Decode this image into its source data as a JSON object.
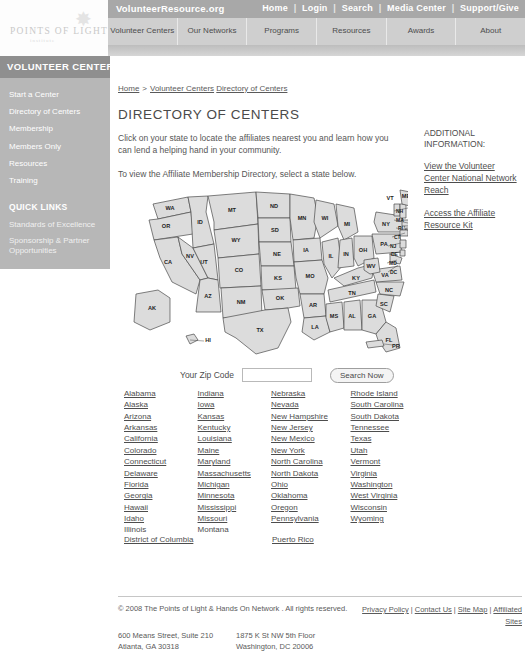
{
  "brand": {
    "logo_text": "POINTS OF LIGHT",
    "logo_subtext": "institute",
    "star_icon": "✸"
  },
  "header": {
    "site_title": "VolunteerResource.org",
    "util_links": [
      "Home",
      "Login",
      "Search",
      "Media Center",
      "Support/Give"
    ],
    "separator": "|",
    "tabs": [
      "Volunteer Centers",
      "Our Networks",
      "Programs",
      "Resources",
      "Awards",
      "About"
    ]
  },
  "sidebar": {
    "title": "VOLUNTEER CENTERS",
    "items": [
      "Start a Center",
      "Directory of Centers",
      "Membership",
      "Members Only",
      "Resources",
      "Training"
    ],
    "quick_links_title": "QUICK LINKS",
    "quick_links": [
      "Standards of Excellence",
      "Sponsorship & Partner Opportunities"
    ]
  },
  "breadcrumb": {
    "home": "Home",
    "separator": ">",
    "section": "Volunteer Centers",
    "current": "Directory of Centers"
  },
  "main": {
    "page_title": "DIRECTORY OF CENTERS",
    "intro": "Click on your state to locate the affiliates nearest you and learn how you can lend a helping hand in your community.",
    "instruction": "To view the Affiliate Membership Directory, select a state below."
  },
  "rail": {
    "heading": "ADDITIONAL INFORMATION:",
    "links": [
      "View the Volunteer Center National Network Reach",
      "Access the Affiliate Resource Kit"
    ]
  },
  "map": {
    "alt": "Clickable map of the United States",
    "state_abbrs": [
      "WA",
      "OR",
      "ID",
      "MT",
      "ND",
      "MN",
      "WI",
      "MI",
      "NY",
      "VT",
      "ME",
      "NH",
      "MA",
      "RI",
      "CT",
      "NJ",
      "DE",
      "MD",
      "DC",
      "PA",
      "OH",
      "IN",
      "IL",
      "IA",
      "NE",
      "SD",
      "WY",
      "UT",
      "NV",
      "CA",
      "AZ",
      "NM",
      "CO",
      "KS",
      "MO",
      "KY",
      "WV",
      "VA",
      "NC",
      "SC",
      "GA",
      "FL",
      "AL",
      "MS",
      "TN",
      "AR",
      "LA",
      "OK",
      "TX",
      "AK",
      "HI",
      "PR"
    ]
  },
  "search": {
    "zip_label": "Your Zip Code",
    "zip_value": "",
    "zip_placeholder": "",
    "button_label": "Search Now"
  },
  "state_columns": [
    [
      "Alabama",
      "Alaska",
      "Arizona",
      "Arkansas",
      "California",
      "Colorado",
      "Connecticut",
      "Delaware",
      "Florida",
      "Georgia",
      "Hawaii",
      "Idaho",
      "Illinois"
    ],
    [
      "Indiana",
      "Iowa",
      "Kansas",
      "Kentucky",
      "Louisiana",
      "Maine",
      "Maryland",
      "Massachusetts",
      "Michigan",
      "Minnesota",
      "Mississippi",
      "Missouri",
      "Montana"
    ],
    [
      "Nebraska",
      "Nevada",
      "New Hampshire",
      "New Jersey",
      "New Mexico",
      "New York",
      "North Carolina",
      "North Dakota",
      "Ohio",
      "Oklahoma",
      "Oregon",
      "Pennsylvania"
    ],
    [
      "Rhode Island",
      "South Carolina",
      "South Dakota",
      "Tennessee",
      "Texas",
      "Utah",
      "Vermont",
      "Virginia",
      "Washington",
      "West Virginia",
      "Wisconsin",
      "Wyoming"
    ]
  ],
  "territories": [
    "District of Columbia",
    "Puerto Rico"
  ],
  "footer": {
    "copyright": "© 2008 The Points of Light & Hands On Network . All rights reserved.",
    "address_1_line_1": "600 Means Street, Suite 210",
    "address_1_line_2": "Atlanta, GA 30318",
    "address_2_line_1": "1875 K St NW 5th Floor",
    "address_2_line_2": "Washington, DC 20006",
    "links": [
      "Privacy Policy",
      "Contact Us",
      "Site Map",
      "Affiliated Sites"
    ],
    "separator": "|"
  },
  "colors": {
    "utilbar": "#a8a8a8",
    "mainnav": "#cfcfcf",
    "sidebar_title": "#8f8f8f",
    "sidebar_body": "#b7b7b7",
    "text": "#4d4d4d"
  }
}
